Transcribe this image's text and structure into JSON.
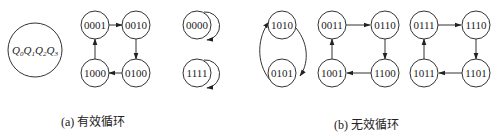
{
  "diagram": {
    "legend": {
      "label_parts": [
        {
          "var": "Q",
          "sub": "0"
        },
        {
          "var": "Q",
          "sub": "1"
        },
        {
          "var": "Q",
          "sub": "2"
        },
        {
          "var": "Q",
          "sub": "3"
        }
      ]
    },
    "effective_cycle": {
      "caption": "(a)  有效循环",
      "states": [
        "0001",
        "0010",
        "0100",
        "1000"
      ],
      "transitions": [
        [
          "0001",
          "0010"
        ],
        [
          "0010",
          "0100"
        ],
        [
          "0100",
          "1000"
        ],
        [
          "1000",
          "0001"
        ]
      ]
    },
    "ineffective_cycles": {
      "caption": "(b)  无效循环",
      "self_loops": [
        "0000",
        "1111"
      ],
      "pair_cycle": {
        "states": [
          "1010",
          "0101"
        ],
        "transitions": [
          [
            "1010",
            "0101"
          ],
          [
            "0101",
            "1010"
          ]
        ]
      },
      "cycle_1": {
        "states": [
          "0011",
          "0110",
          "1100",
          "1001"
        ],
        "transitions": [
          [
            "0011",
            "0110"
          ],
          [
            "0110",
            "1100"
          ],
          [
            "1100",
            "1001"
          ],
          [
            "1001",
            "0011"
          ]
        ]
      },
      "cycle_2": {
        "states": [
          "0111",
          "1110",
          "1101",
          "1011"
        ],
        "transitions": [
          [
            "0111",
            "1110"
          ],
          [
            "1110",
            "1101"
          ],
          [
            "1101",
            "1011"
          ],
          [
            "1011",
            "0111"
          ]
        ]
      }
    }
  }
}
